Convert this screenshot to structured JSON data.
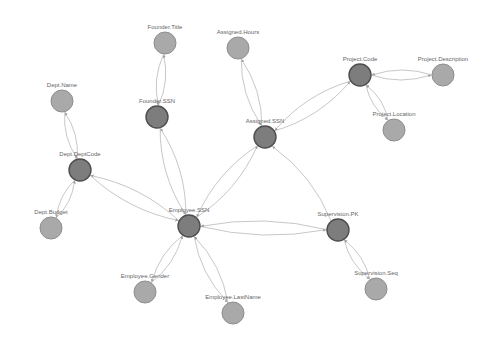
{
  "diagram": {
    "type": "directed-graph",
    "colors": {
      "background": "#ffffff",
      "key_node_fill": "#7d7d7d",
      "key_node_stroke": "#4e4e4e",
      "attribute_node_fill": "#a9a9a9",
      "attribute_node_stroke": "#8e8e8e",
      "edge": "#b9b9b9",
      "label": "#666666"
    },
    "nodes": [
      {
        "id": "founder_title",
        "label": "Founder.Title",
        "kind": "attribute",
        "x": 165,
        "y": 43,
        "r": 11
      },
      {
        "id": "assigned_hours",
        "label": "Assigned.Hours",
        "kind": "attribute",
        "x": 238,
        "y": 48,
        "r": 11
      },
      {
        "id": "project_code",
        "label": "Project.Code",
        "kind": "key",
        "x": 360,
        "y": 75,
        "r": 11
      },
      {
        "id": "project_description",
        "label": "Project.Description",
        "kind": "attribute",
        "x": 443,
        "y": 75,
        "r": 11
      },
      {
        "id": "dept_name",
        "label": "Dept.Name",
        "kind": "attribute",
        "x": 62,
        "y": 101,
        "r": 11
      },
      {
        "id": "founder_ssn",
        "label": "Founder.SSN",
        "kind": "key",
        "x": 157,
        "y": 117,
        "r": 11
      },
      {
        "id": "assigned_ssn",
        "label": "Assigned.SSN",
        "kind": "key",
        "x": 265,
        "y": 137,
        "r": 11
      },
      {
        "id": "project_location",
        "label": "Project.Location",
        "kind": "attribute",
        "x": 394,
        "y": 130,
        "r": 11
      },
      {
        "id": "dept_deptcode",
        "label": "Dept.DeptCode",
        "kind": "key",
        "x": 80,
        "y": 170,
        "r": 11
      },
      {
        "id": "dept_budget",
        "label": "Dept.Budget",
        "kind": "attribute",
        "x": 51,
        "y": 228,
        "r": 11
      },
      {
        "id": "employee_ssn",
        "label": "Employee.SSN",
        "kind": "key",
        "x": 189,
        "y": 226,
        "r": 11
      },
      {
        "id": "supervision_pk",
        "label": "Supervision.PK",
        "kind": "key",
        "x": 338,
        "y": 230,
        "r": 11
      },
      {
        "id": "supervision_seq",
        "label": "Supervision.Seq",
        "kind": "attribute",
        "x": 376,
        "y": 289,
        "r": 11
      },
      {
        "id": "employee_gender",
        "label": "Employee.Gender",
        "kind": "attribute",
        "x": 145,
        "y": 292,
        "r": 11
      },
      {
        "id": "employee_lastname",
        "label": "Employee.LastName",
        "kind": "attribute",
        "x": 233,
        "y": 313,
        "r": 11
      }
    ],
    "edges": [
      {
        "from": "founder_ssn",
        "to": "founder_title"
      },
      {
        "from": "founder_title",
        "to": "founder_ssn"
      },
      {
        "from": "assigned_ssn",
        "to": "assigned_hours"
      },
      {
        "from": "assigned_hours",
        "to": "assigned_ssn"
      },
      {
        "from": "project_code",
        "to": "project_description"
      },
      {
        "from": "project_description",
        "to": "project_code"
      },
      {
        "from": "project_code",
        "to": "project_location"
      },
      {
        "from": "project_location",
        "to": "project_code"
      },
      {
        "from": "assigned_ssn",
        "to": "project_code"
      },
      {
        "from": "project_code",
        "to": "assigned_ssn"
      },
      {
        "from": "dept_deptcode",
        "to": "dept_name"
      },
      {
        "from": "dept_name",
        "to": "dept_deptcode"
      },
      {
        "from": "dept_deptcode",
        "to": "dept_budget"
      },
      {
        "from": "dept_budget",
        "to": "dept_deptcode"
      },
      {
        "from": "employee_ssn",
        "to": "dept_deptcode"
      },
      {
        "from": "dept_deptcode",
        "to": "employee_ssn"
      },
      {
        "from": "employee_ssn",
        "to": "founder_ssn"
      },
      {
        "from": "founder_ssn",
        "to": "employee_ssn"
      },
      {
        "from": "employee_ssn",
        "to": "assigned_ssn"
      },
      {
        "from": "assigned_ssn",
        "to": "employee_ssn"
      },
      {
        "from": "employee_ssn",
        "to": "supervision_pk"
      },
      {
        "from": "supervision_pk",
        "to": "employee_ssn"
      },
      {
        "from": "supervision_pk",
        "to": "assigned_ssn"
      },
      {
        "from": "supervision_pk",
        "to": "supervision_seq"
      },
      {
        "from": "supervision_seq",
        "to": "supervision_pk"
      },
      {
        "from": "employee_ssn",
        "to": "employee_gender"
      },
      {
        "from": "employee_gender",
        "to": "employee_ssn"
      },
      {
        "from": "employee_ssn",
        "to": "employee_lastname"
      },
      {
        "from": "employee_lastname",
        "to": "employee_ssn"
      }
    ]
  }
}
